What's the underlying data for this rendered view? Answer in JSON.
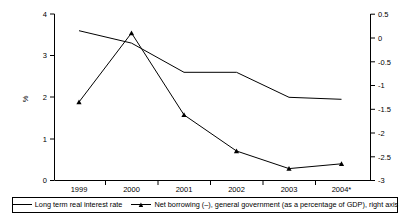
{
  "chart_data": {
    "type": "line",
    "title": "",
    "xlabel": "",
    "ylabel": "%",
    "categories": [
      "1999",
      "2000",
      "2001",
      "2002",
      "2003",
      "2004*"
    ],
    "ylim": [
      0,
      4
    ],
    "y2lim": [
      -3,
      0.5
    ],
    "grid": false,
    "legend_position": "bottom",
    "y_ticks": [
      "0",
      "1",
      "2",
      "3",
      "4"
    ],
    "y2_ticks": [
      "-3",
      "-2.5",
      "-2",
      "-1.5",
      "-1",
      "-0.5",
      "0",
      "0.5"
    ],
    "series": [
      {
        "name": "Long term real interest rate",
        "axis": "left",
        "marker": "none",
        "values": [
          3.6,
          3.3,
          2.6,
          2.6,
          2.0,
          1.95
        ]
      },
      {
        "name": "Net borrowing (–), general government (as a percentage of GDP), right axis",
        "axis": "right",
        "marker": "triangle",
        "values": [
          -1.35,
          0.1,
          -1.62,
          -2.38,
          -2.75,
          -2.65
        ]
      }
    ]
  },
  "legend": {
    "items": [
      {
        "label": "Long term real interest rate",
        "marker": "line"
      },
      {
        "label": "Net borrowing (–), general government (as a percentage of GDP), right axis",
        "marker": "line-triangle"
      }
    ]
  },
  "axes": {
    "left_title": "%"
  }
}
